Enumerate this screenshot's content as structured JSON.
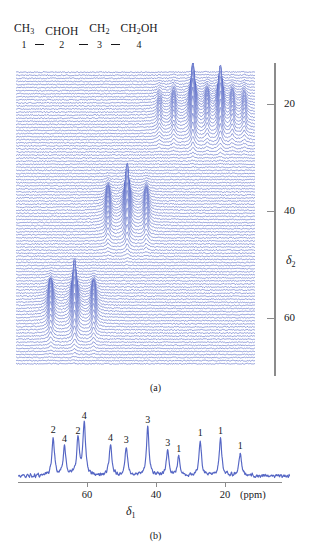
{
  "structure": {
    "units": [
      {
        "formula_html": "CH<sub>3</sub>",
        "index": "1"
      },
      {
        "formula_html": "CHOH",
        "index": "2"
      },
      {
        "formula_html": "CH<sub>2</sub>",
        "index": "3"
      },
      {
        "formula_html": "CH<sub>2</sub>OH",
        "index": "4"
      }
    ],
    "plain": "CH3-CHOH-CH2-CH2OH"
  },
  "captions": {
    "panel_a": "(a)",
    "panel_b": "(b)"
  },
  "axes": {
    "delta2_name": "δ",
    "delta2_sub": "2",
    "delta1_name": "δ",
    "delta1_sub": "1",
    "unit": "(ppm)",
    "delta2_ticks": [
      {
        "value": "20",
        "y": 41
      },
      {
        "value": "40",
        "y": 148
      },
      {
        "value": "60",
        "y": 255
      }
    ],
    "delta1_ticks": [
      {
        "value": "60",
        "x": 69
      },
      {
        "value": "40",
        "x": 138
      },
      {
        "value": "20",
        "x": 207
      }
    ]
  },
  "colors": {
    "trace": "#5566c4",
    "trace_light": "#8e9ada",
    "axis": "#8b8b8b",
    "text": "#17171a",
    "background": "#ffffff"
  },
  "chart_data": [
    {
      "type": "line",
      "name": "2D J-resolved stacked plot",
      "title": "",
      "xlabel": "",
      "ylabel": "δ2 (ppm)",
      "ylim": [
        13,
        71
      ],
      "xlim": [
        72,
        12
      ],
      "n_traces": 96,
      "grid": false,
      "legend": false,
      "clusters": [
        {
          "label": "C1 methyl region",
          "delta2_center": 21,
          "peaks": [
            {
              "x": 0.6,
              "height": 0.22
            },
            {
              "x": 0.66,
              "height": 0.3
            },
            {
              "x": 0.74,
              "height": 1.0
            },
            {
              "x": 0.8,
              "height": 0.34
            },
            {
              "x": 0.855,
              "height": 0.92
            },
            {
              "x": 0.905,
              "height": 0.3
            },
            {
              "x": 0.955,
              "height": 0.26
            }
          ]
        },
        {
          "label": "C4 hydroxymethyl region",
          "delta2_center": 41,
          "peaks": [
            {
              "x": 0.385,
              "height": 0.46
            },
            {
              "x": 0.465,
              "height": 1.0
            },
            {
              "x": 0.545,
              "height": 0.42
            }
          ]
        },
        {
          "label": "C2/C3 region",
          "delta2_center": 60,
          "peaks": [
            {
              "x": 0.145,
              "height": 0.56
            },
            {
              "x": 0.245,
              "height": 1.0
            },
            {
              "x": 0.325,
              "height": 0.5
            }
          ]
        }
      ]
    },
    {
      "type": "line",
      "name": "1D proton-decoupled spectrum",
      "title": "",
      "xlabel": "δ1 (ppm)",
      "ylabel": "",
      "xlim": [
        75,
        12
      ],
      "grid": false,
      "legend": false,
      "peaks": [
        {
          "ppm": 69.8,
          "height": 0.68,
          "label": "2"
        },
        {
          "ppm": 66.5,
          "height": 0.52,
          "label": "4"
        },
        {
          "ppm": 62.6,
          "height": 0.66,
          "label": "2"
        },
        {
          "ppm": 60.8,
          "height": 0.92,
          "label": "4"
        },
        {
          "ppm": 53.2,
          "height": 0.54,
          "label": "4"
        },
        {
          "ppm": 48.6,
          "height": 0.5,
          "label": "3"
        },
        {
          "ppm": 42.4,
          "height": 0.85,
          "label": "3"
        },
        {
          "ppm": 36.6,
          "height": 0.44,
          "label": "3"
        },
        {
          "ppm": 33.4,
          "height": 0.34,
          "label": "1"
        },
        {
          "ppm": 27.2,
          "height": 0.62,
          "label": "1"
        },
        {
          "ppm": 21.3,
          "height": 0.66,
          "label": "1"
        },
        {
          "ppm": 15.6,
          "height": 0.4,
          "label": "1"
        }
      ]
    }
  ]
}
